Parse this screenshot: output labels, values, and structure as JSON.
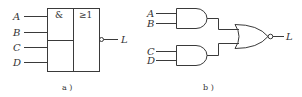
{
  "diagram_a": {
    "caption": "a )",
    "and_symbol": "&",
    "or_symbol": "≥1",
    "inputs": [
      "A",
      "B",
      "C",
      "D"
    ],
    "output": "L"
  },
  "diagram_b": {
    "caption": "b )",
    "gate1_inputs": [
      "A",
      "B"
    ],
    "gate2_inputs": [
      "C",
      "D"
    ],
    "output": "L"
  }
}
